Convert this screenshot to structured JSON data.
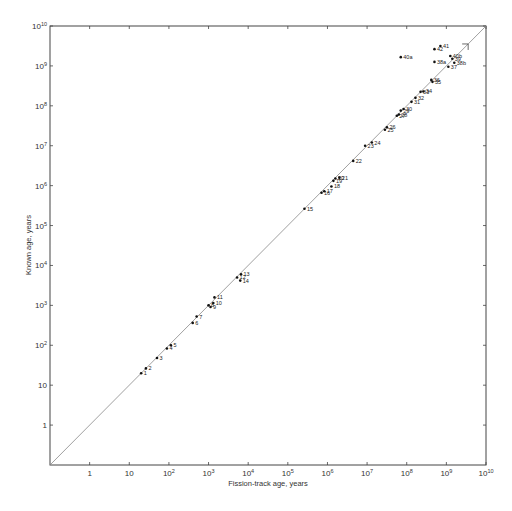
{
  "chart_data": {
    "type": "scatter",
    "title": "",
    "xlabel": "Fission-track age, years",
    "ylabel": "Known age, years",
    "xscale": "log",
    "yscale": "log",
    "xlim_log10": [
      -1,
      10
    ],
    "ylim_log10": [
      -1,
      10
    ],
    "x_tick_labels": [
      "1",
      "10",
      "10^2",
      "10^3",
      "10^4",
      "10^5",
      "10^6",
      "10^7",
      "10^8",
      "10^9",
      "10^10"
    ],
    "y_tick_labels": [
      "1",
      "10",
      "10^2",
      "10^3",
      "10^4",
      "10^5",
      "10^6",
      "10^7",
      "10^8",
      "10^9",
      "10^10"
    ],
    "grid": false,
    "reference_line": "y = x",
    "points": [
      {
        "label": "1",
        "x_log": 1.3,
        "y_log": 1.3
      },
      {
        "label": "2",
        "x_log": 1.42,
        "y_log": 1.42
      },
      {
        "label": "3",
        "x_log": 1.7,
        "y_log": 1.68
      },
      {
        "label": "4",
        "x_log": 1.95,
        "y_log": 1.92
      },
      {
        "label": "5",
        "x_log": 2.05,
        "y_log": 2.0
      },
      {
        "label": "6",
        "x_log": 2.6,
        "y_log": 2.56
      },
      {
        "label": "7",
        "x_log": 2.7,
        "y_log": 2.72
      },
      {
        "label": "8",
        "x_log": 3.0,
        "y_log": 3.0
      },
      {
        "label": "9",
        "x_log": 3.05,
        "y_log": 2.96
      },
      {
        "label": "10",
        "x_log": 3.12,
        "y_log": 3.06
      },
      {
        "label": "11",
        "x_log": 3.15,
        "y_log": 3.2
      },
      {
        "label": "12",
        "x_log": 3.72,
        "y_log": 3.7
      },
      {
        "label": "13",
        "x_log": 3.82,
        "y_log": 3.78
      },
      {
        "label": "14",
        "x_log": 3.8,
        "y_log": 3.62
      },
      {
        "label": "15",
        "x_log": 5.42,
        "y_log": 5.42
      },
      {
        "label": "16",
        "x_log": 5.85,
        "y_log": 5.82
      },
      {
        "label": "17",
        "x_log": 5.92,
        "y_log": 5.86
      },
      {
        "label": "18",
        "x_log": 6.1,
        "y_log": 5.98
      },
      {
        "label": "19",
        "x_log": 6.15,
        "y_log": 6.12
      },
      {
        "label": "20",
        "x_log": 6.2,
        "y_log": 6.18
      },
      {
        "label": "21",
        "x_log": 6.3,
        "y_log": 6.2
      },
      {
        "label": "22",
        "x_log": 6.65,
        "y_log": 6.62
      },
      {
        "label": "23",
        "x_log": 6.95,
        "y_log": 7.0
      },
      {
        "label": "24",
        "x_log": 7.12,
        "y_log": 7.08
      },
      {
        "label": "25",
        "x_log": 7.45,
        "y_log": 7.4
      },
      {
        "label": "26",
        "x_log": 7.5,
        "y_log": 7.46
      },
      {
        "label": "27",
        "x_log": 7.75,
        "y_log": 7.75
      },
      {
        "label": "28",
        "x_log": 7.8,
        "y_log": 7.78
      },
      {
        "label": "29",
        "x_log": 7.85,
        "y_log": 7.88
      },
      {
        "label": "30",
        "x_log": 7.92,
        "y_log": 7.92
      },
      {
        "label": "31",
        "x_log": 8.12,
        "y_log": 8.1
      },
      {
        "label": "32",
        "x_log": 8.22,
        "y_log": 8.2
      },
      {
        "label": "33",
        "x_log": 8.35,
        "y_log": 8.35
      },
      {
        "label": "34",
        "x_log": 8.42,
        "y_log": 8.36
      },
      {
        "label": "35",
        "x_log": 8.65,
        "y_log": 8.6
      },
      {
        "label": "36",
        "x_log": 8.62,
        "y_log": 8.65
      },
      {
        "label": "37",
        "x_log": 9.05,
        "y_log": 8.98
      },
      {
        "label": "38a",
        "x_log": 8.7,
        "y_log": 9.1
      },
      {
        "label": "38b",
        "x_log": 9.2,
        "y_log": 9.08
      },
      {
        "label": "39",
        "x_log": 9.15,
        "y_log": 9.18
      },
      {
        "label": "40a",
        "x_log": 7.85,
        "y_log": 9.22
      },
      {
        "label": "40b",
        "x_log": 9.1,
        "y_log": 9.25
      },
      {
        "label": "41",
        "x_log": 8.85,
        "y_log": 9.5
      },
      {
        "label": "42",
        "x_log": 8.7,
        "y_log": 9.42
      }
    ]
  }
}
